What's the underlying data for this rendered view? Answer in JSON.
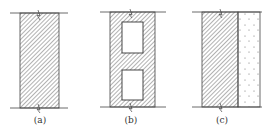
{
  "panels": [
    {
      "id": "a",
      "label": "(a)",
      "type": "solid-wall"
    },
    {
      "id": "b",
      "label": "(b)",
      "type": "hollow-wall"
    },
    {
      "id": "c",
      "label": "(c)",
      "type": "composite-wall"
    }
  ],
  "colors": {
    "line": "#444444",
    "hatch": "#555555",
    "fill": "#ffffff"
  }
}
